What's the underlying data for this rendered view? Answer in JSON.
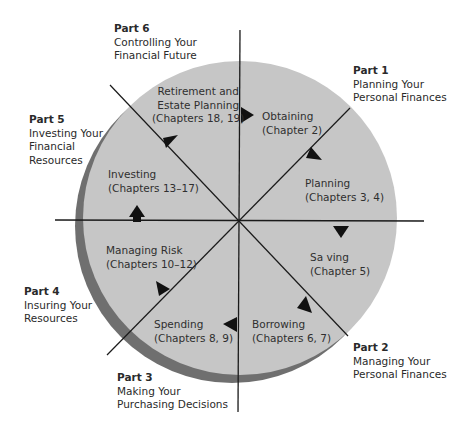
{
  "colors": {
    "wheel_fill": "#c6c6c6",
    "wheel_shadow": "#6f6f6f",
    "lines": "#1a1a1a",
    "arrows": "#111111"
  },
  "parts": [
    {
      "title": "Part 1",
      "desc": [
        "Planning Your",
        "Personal Finances"
      ]
    },
    {
      "title": "Part 2",
      "desc": [
        "Managing Your",
        "Personal Finances"
      ]
    },
    {
      "title": "Part 3",
      "desc": [
        "Making Your",
        "Purchasing Decisions"
      ]
    },
    {
      "title": "Part 4",
      "desc": [
        "Insuring Your",
        "Resources"
      ]
    },
    {
      "title": "Part 5",
      "desc": [
        "Investing Your",
        "Financial",
        "Resources"
      ]
    },
    {
      "title": "Part 6",
      "desc": [
        "Controlling Your",
        "Financial Future"
      ]
    }
  ],
  "segments": [
    {
      "name": "Obtaining",
      "chapters": "(Chapter 2)"
    },
    {
      "name": "Planning",
      "chapters": "(Chapters 3, 4)"
    },
    {
      "name": "Sa ving",
      "chapters": "(Chapter 5)"
    },
    {
      "name": "Borrowing",
      "chapters": "(Chapters 6, 7)"
    },
    {
      "name": "Spending",
      "chapters": "(Chapters 8, 9)"
    },
    {
      "name": "Managing Risk",
      "chapters": "(Chapters 10–12)"
    },
    {
      "name": "Investing",
      "chapters": "(Chapters 13–17)"
    },
    {
      "name": "Retirement and",
      "name2": "Estate Planning",
      "chapters": "(Chapters 18, 19)"
    }
  ]
}
